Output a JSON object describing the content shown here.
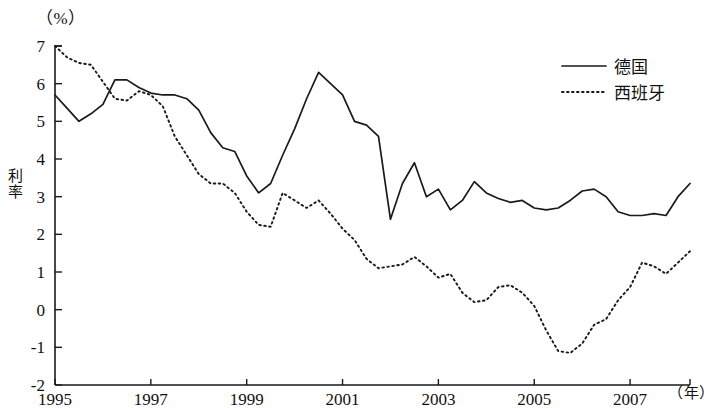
{
  "chart_data": {
    "type": "line",
    "title": "",
    "xlabel": "（年）",
    "ylabel": "利率",
    "yunit": "（%）",
    "xlim": [
      1995,
      2008.25
    ],
    "ylim": [
      -2,
      7
    ],
    "grid": false,
    "legend_position": "top-right",
    "ytick_labels": [
      "7",
      "6",
      "5",
      "4",
      "3",
      "2",
      "1",
      "0",
      "-1",
      "-2"
    ],
    "ytick_values": [
      7,
      6,
      5,
      4,
      3,
      2,
      1,
      0,
      -1,
      -2
    ],
    "xtick_labels": [
      "1995",
      "1997",
      "1999",
      "2001",
      "2003",
      "2005",
      "2007"
    ],
    "xtick_values": [
      1995,
      1997,
      1999,
      2001,
      2003,
      2005,
      2007
    ],
    "x": [
      1995.0,
      1995.25,
      1995.5,
      1995.75,
      1996.0,
      1996.25,
      1996.5,
      1996.75,
      1997.0,
      1997.25,
      1997.5,
      1997.75,
      1998.0,
      1998.25,
      1998.5,
      1998.75,
      1999.0,
      1999.25,
      1999.5,
      1999.75,
      2000.0,
      2000.25,
      2000.5,
      2000.75,
      2001.0,
      2001.25,
      2001.5,
      2001.75,
      2002.0,
      2002.25,
      2002.5,
      2002.75,
      2003.0,
      2003.25,
      2003.5,
      2003.75,
      2004.0,
      2004.25,
      2004.5,
      2004.75,
      2005.0,
      2005.25,
      2005.5,
      2005.75,
      2006.0,
      2006.25,
      2006.5,
      2006.75,
      2007.0,
      2007.25,
      2007.5,
      2007.75,
      2008.0,
      2008.25
    ],
    "series": [
      {
        "name": "德国",
        "style": "solid",
        "values": [
          5.7,
          5.35,
          5.0,
          5.2,
          5.45,
          6.1,
          6.1,
          5.9,
          5.75,
          5.7,
          5.7,
          5.6,
          5.3,
          4.7,
          4.3,
          4.2,
          3.55,
          3.1,
          3.35,
          4.1,
          4.8,
          5.6,
          6.3,
          6.0,
          5.7,
          5.0,
          4.9,
          4.6,
          2.4,
          3.35,
          3.9,
          3.0,
          3.2,
          2.65,
          2.9,
          3.4,
          3.1,
          2.95,
          2.85,
          2.9,
          2.7,
          2.65,
          2.7,
          2.9,
          3.15,
          3.2,
          3.0,
          2.6,
          2.5,
          2.5,
          2.55,
          2.5,
          3.0,
          3.35
        ]
      },
      {
        "name": "西班牙",
        "style": "dotted",
        "values": [
          7.0,
          6.7,
          6.55,
          6.5,
          6.05,
          5.6,
          5.55,
          5.8,
          5.7,
          5.4,
          4.6,
          4.1,
          3.6,
          3.35,
          3.35,
          3.1,
          2.6,
          2.25,
          2.2,
          3.1,
          2.9,
          2.7,
          2.9,
          2.55,
          2.15,
          1.85,
          1.35,
          1.1,
          1.15,
          1.2,
          1.4,
          1.15,
          0.85,
          0.95,
          0.45,
          0.2,
          0.25,
          0.6,
          0.65,
          0.45,
          0.1,
          -0.55,
          -1.1,
          -1.15,
          -0.9,
          -0.4,
          -0.25,
          0.25,
          0.6,
          1.25,
          1.15,
          0.95,
          1.25,
          1.55
        ]
      }
    ]
  },
  "legend": {
    "items": [
      {
        "label": "德国",
        "style": "solid"
      },
      {
        "label": "西班牙",
        "style": "dotted"
      }
    ]
  }
}
